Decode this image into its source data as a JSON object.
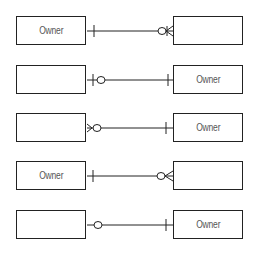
{
  "diagram": {
    "type": "entity-relationship cardinality examples",
    "rows": [
      {
        "left_label": "Owner",
        "right_label": "",
        "left_end": "one",
        "right_end": "zero-or-many"
      },
      {
        "left_label": "",
        "right_label": "Owner",
        "left_end": "zero-or-one",
        "right_end": "one"
      },
      {
        "left_label": "",
        "right_label": "Owner",
        "left_end": "zero-or-many",
        "right_end": "one"
      },
      {
        "left_label": "Owner",
        "right_label": "",
        "left_end": "one",
        "right_end": "zero-or-many"
      },
      {
        "left_label": "",
        "right_label": "Owner",
        "left_end": "zero",
        "right_end": "one"
      }
    ]
  },
  "colors": {
    "line": "#222222",
    "text": "#555555",
    "background": "#ffffff"
  }
}
